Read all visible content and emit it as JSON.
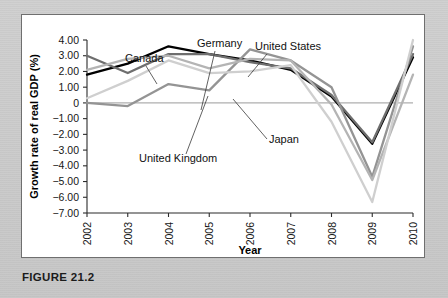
{
  "figure": {
    "caption": "FIGURE 21.2"
  },
  "chart_data": {
    "type": "line",
    "title": "",
    "xlabel": "Year",
    "ylabel": "Growth rate of real GDP (%)",
    "categories": [
      "2002",
      "2003",
      "2004",
      "2005",
      "2006",
      "2007",
      "2008",
      "2009",
      "2010"
    ],
    "x": [
      2002,
      2003,
      2004,
      2005,
      2006,
      2007,
      2008,
      2009,
      2010
    ],
    "ylim": [
      -7.0,
      4.0
    ],
    "xlim": [
      2002,
      2010
    ],
    "yticks": [
      "4.00",
      "3.00",
      "2.00",
      "1.00",
      "0",
      "-1.00",
      "-2.00",
      "-3.00",
      "-4.00",
      "-5.00",
      "-6.00",
      "-7.00"
    ],
    "ytick_values": [
      4.0,
      3.0,
      2.0,
      1.0,
      0.0,
      -1.0,
      -2.0,
      -3.0,
      -4.0,
      -5.0,
      -6.0,
      -7.0
    ],
    "grid": false,
    "legend_position": "inline-annotations",
    "zero_reference_line": true,
    "series": [
      {
        "name": "United States",
        "color": "#000000",
        "width": 2.3,
        "values": [
          1.8,
          2.5,
          3.6,
          3.1,
          2.7,
          2.1,
          0.4,
          -2.6,
          2.9
        ]
      },
      {
        "name": "Canada",
        "color": "#6e6e6e",
        "width": 2.3,
        "values": [
          3.0,
          1.9,
          3.1,
          3.1,
          2.6,
          2.2,
          0.5,
          -2.5,
          3.1
        ]
      },
      {
        "name": "Germany",
        "color": "#949494",
        "width": 2.3,
        "values": [
          0.0,
          -0.2,
          1.2,
          0.8,
          3.4,
          2.7,
          1.0,
          -4.7,
          3.6
        ]
      },
      {
        "name": "United Kingdom",
        "color": "#b4b4b4",
        "width": 2.3,
        "values": [
          2.1,
          2.8,
          3.0,
          2.2,
          2.8,
          2.7,
          -0.1,
          -4.9,
          1.8
        ]
      },
      {
        "name": "Japan",
        "color": "#cfcfcf",
        "width": 2.3,
        "values": [
          0.3,
          1.4,
          2.7,
          1.9,
          2.0,
          2.4,
          -1.2,
          -6.3,
          4.0
        ]
      }
    ],
    "annotations": [
      {
        "text": "Canada",
        "x": 104,
        "y": 48,
        "anchor": "start",
        "leader": [
          [
            125,
            52
          ],
          [
            136,
            70
          ]
        ]
      },
      {
        "text": "Germany",
        "x": 176,
        "y": 33,
        "anchor": "start",
        "leader": [
          [
            194,
            37
          ],
          [
            180,
            96
          ]
        ]
      },
      {
        "text": "United States",
        "x": 234,
        "y": 36,
        "anchor": "start",
        "leader": [
          [
            246,
            40
          ],
          [
            227,
            63
          ]
        ]
      },
      {
        "text": "United Kingdom",
        "x": 118,
        "y": 148,
        "anchor": "start",
        "leader": [
          [
            165,
            140
          ],
          [
            187,
            82
          ]
        ]
      },
      {
        "text": "Japan",
        "x": 248,
        "y": 129,
        "anchor": "start",
        "leader": [
          [
            246,
            125
          ],
          [
            212,
            85
          ]
        ]
      }
    ]
  }
}
